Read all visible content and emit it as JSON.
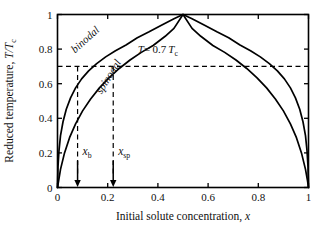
{
  "chart_data": {
    "type": "line",
    "title": "",
    "xlabel": "Initial solute concentration, x",
    "ylabel": "Reduced temperature, T/Tc",
    "xlabel_main": "Initial solute concentration,",
    "xlabel_var": "x",
    "ylabel_main": "Reduced temperature,",
    "ylabel_var": "T/T",
    "ylabel_var_sub": "c",
    "xlim": [
      0,
      1
    ],
    "ylim": [
      0,
      1
    ],
    "grid": false,
    "legend": "none",
    "xticks": [
      0,
      0.2,
      0.4,
      0.6,
      0.8,
      1
    ],
    "xticklabels": [
      "0",
      "0.2",
      "0.4",
      "0.6",
      "0.8",
      "1"
    ],
    "yticks": [
      0,
      0.2,
      0.4,
      0.6,
      0.8,
      1
    ],
    "yticklabels": [
      "0",
      "0.2",
      "0.4",
      "0.6",
      "0.8",
      "1"
    ],
    "series": [
      {
        "name": "binodal",
        "label": "binodal",
        "color": "#000000",
        "x": [
          0.0,
          0.002,
          0.006,
          0.012,
          0.022,
          0.035,
          0.052,
          0.072,
          0.096,
          0.124,
          0.156,
          0.192,
          0.231,
          0.273,
          0.318,
          0.365,
          0.414,
          0.464,
          0.5,
          0.536,
          0.586,
          0.635,
          0.682,
          0.727,
          0.769,
          0.808,
          0.844,
          0.876,
          0.904,
          0.928,
          0.948,
          0.965,
          0.978,
          0.988,
          0.994,
          0.998,
          1.0
        ],
        "y": [
          0.0,
          0.12,
          0.215,
          0.3,
          0.38,
          0.452,
          0.518,
          0.576,
          0.628,
          0.674,
          0.716,
          0.755,
          0.791,
          0.824,
          0.866,
          0.9,
          0.938,
          0.975,
          1.0,
          0.975,
          0.938,
          0.9,
          0.866,
          0.824,
          0.791,
          0.755,
          0.716,
          0.674,
          0.628,
          0.576,
          0.518,
          0.452,
          0.38,
          0.3,
          0.215,
          0.12,
          0.0
        ]
      },
      {
        "name": "spinodal",
        "label": "spinodal",
        "color": "#000000",
        "x": [
          0.0,
          0.012,
          0.028,
          0.048,
          0.072,
          0.1,
          0.132,
          0.167,
          0.205,
          0.246,
          0.289,
          0.334,
          0.381,
          0.429,
          0.464,
          0.5,
          0.536,
          0.571,
          0.619,
          0.666,
          0.711,
          0.754,
          0.795,
          0.833,
          0.868,
          0.9,
          0.928,
          0.952,
          0.972,
          0.988,
          0.996,
          1.0
        ],
        "y": [
          0.0,
          0.105,
          0.2,
          0.288,
          0.368,
          0.443,
          0.512,
          0.576,
          0.634,
          0.688,
          0.737,
          0.781,
          0.821,
          0.874,
          0.92,
          1.0,
          0.92,
          0.874,
          0.821,
          0.781,
          0.737,
          0.688,
          0.634,
          0.576,
          0.512,
          0.443,
          0.368,
          0.288,
          0.2,
          0.105,
          0.04,
          0.0
        ]
      }
    ],
    "annotations": [
      {
        "name": "isotherm-line",
        "type": "hline",
        "y": 0.7,
        "style": "dashed",
        "text": "T = 0.7 Tc",
        "text_parts": {
          "var": "T",
          "eq": "= 0.7 ",
          "var2": "T",
          "sub": "c"
        }
      },
      {
        "name": "binodal-dropline",
        "type": "vline",
        "x": 0.08,
        "y_top": 0.7,
        "style": "dashed",
        "label": "xb",
        "label_main": "x",
        "label_sub": "b"
      },
      {
        "name": "spinodal-dropline",
        "type": "vline",
        "x": 0.222,
        "y_top": 0.7,
        "style": "dashed",
        "label": "xsp",
        "label_main": "x",
        "label_sub": "sp"
      }
    ],
    "curve_label_positions": [
      {
        "name": "binodal",
        "x": 0.12,
        "y": 0.84,
        "rotation": -42
      },
      {
        "name": "spinodal",
        "x": 0.215,
        "y": 0.63,
        "rotation": -58
      }
    ],
    "isotherm_value": 0.7,
    "xb_value": 0.08,
    "xsp_value": 0.222,
    "colors": {
      "curve": "#000000",
      "axis": "#000000",
      "dashed": "#000000",
      "background": "#ffffff"
    }
  }
}
